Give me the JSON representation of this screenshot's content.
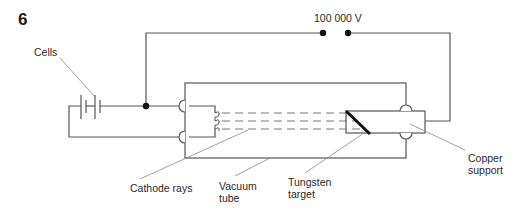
{
  "figure": {
    "number": "6",
    "voltage_label": "100 000 V",
    "labels": {
      "cells": "Cells",
      "cathode_rays": "Cathode rays",
      "vacuum_tube_line1": "Vacuum",
      "vacuum_tube_line2": "tube",
      "tungsten_target_line1": "Tungsten",
      "tungsten_target_line2": "target",
      "copper_support_line1": "Copper",
      "copper_support_line2": "support"
    },
    "colors": {
      "wire": "#555555",
      "leader": "#888888",
      "target": "#111111"
    }
  }
}
